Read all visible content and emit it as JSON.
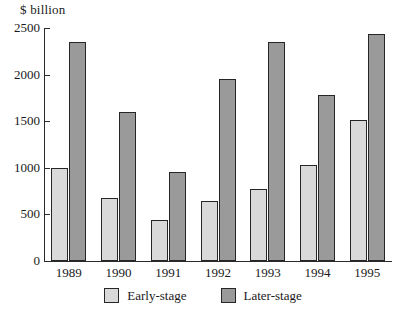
{
  "chart_data": {
    "type": "bar",
    "title": "",
    "subtitle": "",
    "xlabel": "",
    "ylabel": "$ billion",
    "ylim": [
      0,
      2500
    ],
    "ytick_labels": [
      "2500",
      "2000",
      "1500",
      "1000",
      "500",
      "0"
    ],
    "ytick_values": [
      2500,
      2000,
      1500,
      1000,
      500,
      0
    ],
    "grid": false,
    "legend_position": "bottom-center",
    "categories": [
      "1989",
      "1990",
      "1991",
      "1992",
      "1993",
      "1994",
      "1995"
    ],
    "series": [
      {
        "name": "Early-stage",
        "color": "#d9d9d9",
        "values": [
          1000,
          680,
          440,
          640,
          770,
          1030,
          1510
        ]
      },
      {
        "name": "Later-stage",
        "color": "#9a9a9a",
        "values": [
          2350,
          1600,
          950,
          1950,
          2350,
          1780,
          2440
        ]
      }
    ]
  },
  "axis": {
    "y_title": "$ billion",
    "ticks": [
      {
        "label": "2500",
        "value": 2500
      },
      {
        "label": "2000",
        "value": 2000
      },
      {
        "label": "1500",
        "value": 1500
      },
      {
        "label": "1000",
        "value": 1000
      },
      {
        "label": "500",
        "value": 500
      },
      {
        "label": "0",
        "value": 0
      }
    ]
  },
  "categories": [
    {
      "label": "1989"
    },
    {
      "label": "1990"
    },
    {
      "label": "1991"
    },
    {
      "label": "1992"
    },
    {
      "label": "1993"
    },
    {
      "label": "1994"
    },
    {
      "label": "1995"
    }
  ],
  "legend": {
    "items": [
      {
        "label": "Early-stage",
        "color": "#d9d9d9"
      },
      {
        "label": "Later-stage",
        "color": "#9a9a9a"
      }
    ]
  }
}
